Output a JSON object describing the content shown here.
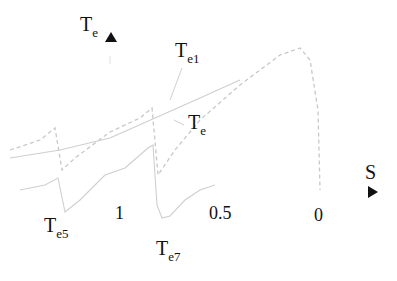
{
  "diagram": {
    "y_axis": {
      "symbol": "T",
      "subscript": "e",
      "arrow": "up-triangle"
    },
    "x_axis": {
      "symbol": "S",
      "arrow": "right-triangle"
    },
    "ticks": [
      "1",
      "0.5",
      "0"
    ],
    "labels": [
      {
        "symbol": "T",
        "subscript": "e1"
      },
      {
        "symbol": "T",
        "subscript": "e"
      },
      {
        "symbol": "T",
        "subscript": "e5"
      },
      {
        "symbol": "T",
        "subscript": "e7"
      }
    ],
    "curve_color": "#c8c8c8",
    "text_color": "#111111"
  }
}
